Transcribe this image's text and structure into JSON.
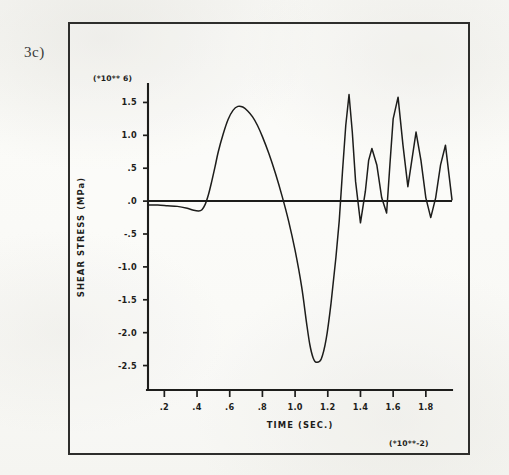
{
  "figure": {
    "label": "3c)"
  },
  "chart_data": {
    "type": "line",
    "title": "",
    "xlabel": "TIME (SEC.)",
    "ylabel": "SHEAR STRESS (MPa)",
    "x_multiplier_label": "(*10**-2)",
    "y_multiplier_label": "(*10** 6)",
    "xlim": [
      0.1,
      1.96
    ],
    "ylim": [
      -2.75,
      1.75
    ],
    "xticks": [
      0.2,
      0.4,
      0.6,
      0.8,
      1.0,
      1.2,
      1.4,
      1.6,
      1.8
    ],
    "xtick_labels": [
      ".2",
      ".4",
      ".6",
      ".8",
      "1.0",
      "1.2",
      "1.4",
      "1.6",
      "1.8"
    ],
    "yticks": [
      1.5,
      1.0,
      0.5,
      0.0,
      -0.5,
      -1.0,
      -1.5,
      -2.0,
      -2.5
    ],
    "ytick_labels": [
      "1.5",
      "1.0",
      ".5",
      ".0",
      "-.5",
      "-1.0",
      "-1.5",
      "-2.0",
      "-2.5"
    ],
    "grid": false,
    "legend": "none",
    "zero_reference_line": 0.0,
    "series": [
      {
        "name": "shear stress",
        "color": "#1d1d1b",
        "x": [
          0.1,
          0.16,
          0.22,
          0.28,
          0.34,
          0.38,
          0.41,
          0.43,
          0.45,
          0.47,
          0.49,
          0.51,
          0.53,
          0.56,
          0.59,
          0.62,
          0.65,
          0.68,
          0.71,
          0.74,
          0.77,
          0.8,
          0.84,
          0.88,
          0.92,
          0.96,
          1.0,
          1.04,
          1.07,
          1.09,
          1.11,
          1.13,
          1.16,
          1.19,
          1.22,
          1.25,
          1.27,
          1.29,
          1.31,
          1.33,
          1.35,
          1.37,
          1.4,
          1.43,
          1.45,
          1.47,
          1.5,
          1.53,
          1.56,
          1.58,
          1.6,
          1.63,
          1.66,
          1.69,
          1.71,
          1.74,
          1.77,
          1.8,
          1.83,
          1.86,
          1.89,
          1.92,
          1.96
        ],
        "y": [
          -0.06,
          -0.06,
          -0.07,
          -0.08,
          -0.11,
          -0.14,
          -0.15,
          -0.13,
          -0.05,
          0.1,
          0.3,
          0.52,
          0.75,
          1.02,
          1.24,
          1.38,
          1.44,
          1.43,
          1.37,
          1.28,
          1.15,
          0.98,
          0.72,
          0.42,
          0.08,
          -0.3,
          -0.75,
          -1.3,
          -1.85,
          -2.18,
          -2.38,
          -2.45,
          -2.4,
          -2.1,
          -1.55,
          -0.85,
          -0.3,
          0.45,
          1.15,
          1.62,
          1.05,
          0.3,
          -0.33,
          0.15,
          0.62,
          0.8,
          0.55,
          0.05,
          -0.18,
          0.55,
          1.25,
          1.58,
          0.85,
          0.22,
          0.55,
          1.05,
          0.62,
          0.05,
          -0.25,
          0.05,
          0.55,
          0.85,
          0.02
        ]
      }
    ]
  }
}
